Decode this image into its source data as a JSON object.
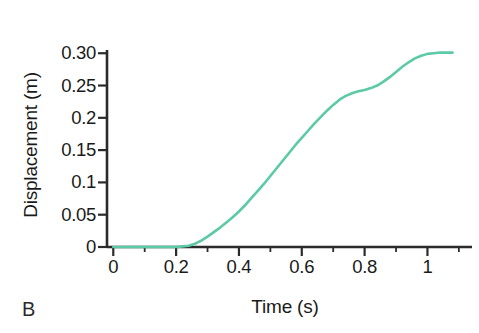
{
  "panel": {
    "letter": "B"
  },
  "chart_data": {
    "type": "line",
    "title": "",
    "subtitle": "",
    "xlabel": "Time (s)",
    "ylabel": "Displacement (m)",
    "xlim": [
      -0.02,
      1.11
    ],
    "ylim": [
      0,
      0.305
    ],
    "grid": false,
    "legend": null,
    "line_color": "#5cc9a7",
    "axis_color": "#2b2b2b",
    "x_ticks": [
      0,
      0.2,
      0.4,
      0.6,
      0.8,
      1
    ],
    "x_tick_labels": [
      "0",
      "0.2",
      "0.4",
      "0.6",
      "0.8",
      "1"
    ],
    "x_minor_ticks": [
      0.1,
      0.3,
      0.5,
      0.7,
      0.9,
      1.1
    ],
    "y_ticks": [
      0,
      0.05,
      0.1,
      0.15,
      0.2,
      0.25,
      0.3
    ],
    "y_tick_labels": [
      "0",
      "0.05",
      "0.1",
      "0.15",
      "0.2",
      "0.25",
      "0.30"
    ],
    "series": [
      {
        "name": "displacement",
        "color": "#5cc9a7",
        "x": [
          0.0,
          0.04,
          0.08,
          0.12,
          0.16,
          0.2,
          0.22,
          0.24,
          0.26,
          0.28,
          0.3,
          0.32,
          0.34,
          0.36,
          0.38,
          0.4,
          0.42,
          0.44,
          0.46,
          0.48,
          0.5,
          0.52,
          0.54,
          0.56,
          0.58,
          0.6,
          0.62,
          0.64,
          0.66,
          0.68,
          0.7,
          0.72,
          0.74,
          0.76,
          0.78,
          0.8,
          0.82,
          0.84,
          0.86,
          0.88,
          0.9,
          0.92,
          0.94,
          0.96,
          0.98,
          1.0,
          1.02,
          1.04,
          1.06,
          1.08
        ],
        "y": [
          0.0,
          0.0,
          0.0,
          0.0,
          0.0,
          0.0,
          0.001,
          0.002,
          0.005,
          0.01,
          0.016,
          0.023,
          0.03,
          0.038,
          0.046,
          0.055,
          0.065,
          0.076,
          0.087,
          0.098,
          0.11,
          0.122,
          0.134,
          0.146,
          0.158,
          0.169,
          0.18,
          0.191,
          0.201,
          0.211,
          0.22,
          0.228,
          0.234,
          0.238,
          0.241,
          0.243,
          0.246,
          0.25,
          0.256,
          0.263,
          0.271,
          0.279,
          0.286,
          0.292,
          0.296,
          0.299,
          0.3,
          0.301,
          0.301,
          0.301
        ]
      }
    ]
  }
}
